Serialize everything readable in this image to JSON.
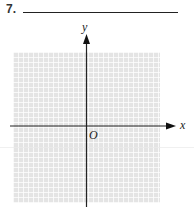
{
  "problem": {
    "number": "7.",
    "answer_blank": ""
  },
  "graph": {
    "x_axis_label": "x",
    "y_axis_label": "y",
    "origin_label": "O",
    "grid_color": "#e4e4e4",
    "axis_color": "#222222"
  }
}
